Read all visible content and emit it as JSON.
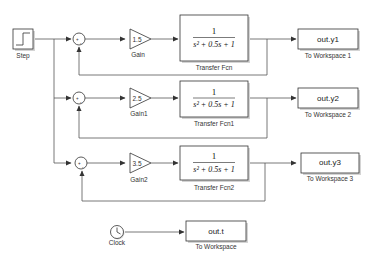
{
  "diagram": {
    "type": "simulink-model",
    "blocks": {
      "step": {
        "label": "Step"
      },
      "clock": {
        "label": "Clock"
      },
      "sums": [
        {
          "signs": "+-"
        },
        {
          "signs": "+-"
        },
        {
          "signs": "+-"
        }
      ],
      "gains": [
        {
          "value": "1.5",
          "label": "Gain"
        },
        {
          "value": "2.5",
          "label": "Gain1"
        },
        {
          "value": "3.5",
          "label": "Gain2"
        }
      ],
      "transfer_fcns": [
        {
          "numerator": "1",
          "denominator": "s² + 0.5s + 1",
          "label": "Transfer Fcn"
        },
        {
          "numerator": "1",
          "denominator": "s² + 0.5s + 1",
          "label": "Transfer Fcn1"
        },
        {
          "numerator": "1",
          "denominator": "s² + 0.5s + 1",
          "label": "Transfer Fcn2"
        }
      ],
      "to_workspace": [
        {
          "variable": "out.y1",
          "label": "To Workspace 1"
        },
        {
          "variable": "out.y2",
          "label": "To Workspace 2"
        },
        {
          "variable": "out.y3",
          "label": "To Workspace 3"
        },
        {
          "variable": "out.t",
          "label": "To Workspace"
        }
      ]
    },
    "connections": [
      "Step -> Sum (+)",
      "Step -> Sum1 (+)",
      "Step -> Sum2 (+)",
      "Sum -> Gain",
      "Gain -> Transfer Fcn",
      "Transfer Fcn -> To Workspace 1",
      "Transfer Fcn -> Sum (-)",
      "Sum1 -> Gain1",
      "Gain1 -> Transfer Fcn1",
      "Transfer Fcn1 -> To Workspace 2",
      "Transfer Fcn1 -> Sum1 (-)",
      "Sum2 -> Gain2",
      "Gain2 -> Transfer Fcn2",
      "Transfer Fcn2 -> To Workspace 3",
      "Transfer Fcn2 -> Sum2 (-)",
      "Clock -> To Workspace"
    ]
  }
}
